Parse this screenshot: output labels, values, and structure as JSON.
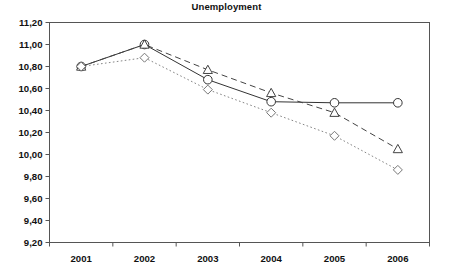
{
  "chart": {
    "title": "Unemployment",
    "type": "line"
  },
  "chart_data": {
    "type": "line",
    "title": "Unemployment",
    "xlabel": "",
    "ylabel": "",
    "categories": [
      "2001",
      "2002",
      "2003",
      "2004",
      "2005",
      "2006"
    ],
    "x": [
      2001,
      2002,
      2003,
      2004,
      2005,
      2006
    ],
    "ylim": [
      9.2,
      11.2
    ],
    "ytick_labels": [
      "11,20",
      "11,00",
      "10,80",
      "10,60",
      "10,40",
      "10,20",
      "10,00",
      "9,80",
      "9,60",
      "9,40",
      "9,20"
    ],
    "ytick_values": [
      11.2,
      11.0,
      10.8,
      10.6,
      10.4,
      10.2,
      10.0,
      9.8,
      9.6,
      9.4,
      9.2
    ],
    "xtick_labels": [
      "2001",
      "2002",
      "2003",
      "2004",
      "2005",
      "2006"
    ],
    "grid": false,
    "legend": "none",
    "decimal_separator": ",",
    "series": [
      {
        "name": "series-1",
        "marker": "circle",
        "line_style": "solid",
        "color": "#333333",
        "values": [
          10.8,
          11.0,
          10.68,
          10.48,
          10.47,
          10.47
        ]
      },
      {
        "name": "series-2",
        "marker": "triangle",
        "line_style": "dashed",
        "color": "#444444",
        "values": [
          10.8,
          11.0,
          10.77,
          10.56,
          10.38,
          10.05
        ]
      },
      {
        "name": "series-3",
        "marker": "diamond",
        "line_style": "dotted",
        "color": "#777777",
        "values": [
          10.8,
          10.88,
          10.59,
          10.38,
          10.17,
          9.86
        ]
      }
    ]
  },
  "axes": {
    "frame_color": "#555555"
  }
}
